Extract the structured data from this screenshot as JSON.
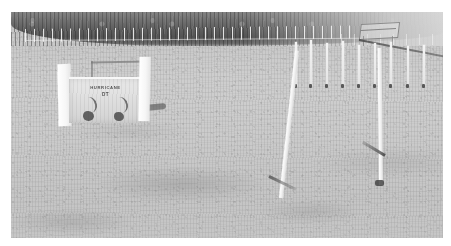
{
  "image": {
    "kind": "photograph",
    "subject": "dog-agility-course-in-grass-field",
    "rendering": "grayscale-halftone-print",
    "border_color": "#ffffff",
    "frame": {
      "x": 11,
      "y": 12,
      "width": 432,
      "height": 226
    }
  },
  "palette": {
    "paper_white": "#ffffff",
    "grass_light": "#cdcdc9",
    "grass_mid": "#c3c4bf",
    "grass_dark": "#b9bab6",
    "treeline_dark": "#44453f",
    "pole_white": "#f4f4f1",
    "shadow_dark": "#3a3b37",
    "sign_panel": "#dededa"
  },
  "scene": {
    "background": {
      "name": "treeline",
      "description": "dark row of trees along the horizon",
      "fence": {
        "name": "picket-fence",
        "description": "white picket fence at the base of the treeline"
      }
    },
    "far_structure": {
      "label": "distant-jump",
      "description": "small distant jump or shed structure at upper right"
    },
    "sign_jump": {
      "name": "hurricane-sign-jump",
      "title": "HURRICANE",
      "subtitle": "DT",
      "description": "white wing jump with a printed panel and two upright posts"
    },
    "weave_poles": {
      "label": "weave-poles",
      "count": 9,
      "description": "row of thin white vertical weave poles set in the grass",
      "poles": [
        {
          "x": 284,
          "y": 30,
          "height": 44
        },
        {
          "x": 299,
          "y": 28,
          "height": 46
        },
        {
          "x": 315,
          "y": 31,
          "height": 43
        },
        {
          "x": 331,
          "y": 29,
          "height": 45
        },
        {
          "x": 347,
          "y": 33,
          "height": 41
        },
        {
          "x": 363,
          "y": 31,
          "height": 43
        },
        {
          "x": 379,
          "y": 30,
          "height": 44
        },
        {
          "x": 396,
          "y": 34,
          "height": 40
        },
        {
          "x": 412,
          "y": 33,
          "height": 41
        }
      ]
    },
    "foreground_poles": [
      {
        "name": "leaning-pole",
        "tilt_deg": 6.2,
        "description": "tall white pole leaning to the right"
      },
      {
        "name": "upright-pole",
        "tilt_deg": -0.6,
        "description": "tall white pole standing vertical with a ground shadow"
      }
    ],
    "ground": {
      "name": "grass-field",
      "description": "mown grass field filling the frame"
    }
  }
}
